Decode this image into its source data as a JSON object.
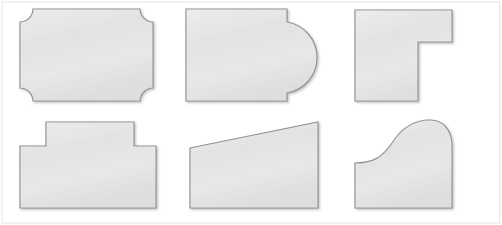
{
  "figure": {
    "width": 502,
    "height": 225,
    "background_color": "#ffffff",
    "frame": {
      "visible": true,
      "color": "#e8e8e8",
      "x": 2,
      "y": 2,
      "width": 498,
      "height": 221
    },
    "style": {
      "fill_color": "#e4e4e4",
      "fill_highlight_color": "#f2f2f2",
      "stroke_color": "#8a8a8a",
      "stroke_width": 1.2,
      "shadow_color": "#bdbdbd"
    },
    "grid": {
      "rows": 2,
      "columns": 3,
      "total_shapes": 6
    }
  },
  "shapes": [
    {
      "index": 1,
      "name": "concave-corner-rectangle",
      "label": "Rectangle with concave rounded corners",
      "row": 1,
      "column": 1,
      "bbox": {
        "x": 20,
        "y": 9,
        "width": 133,
        "height": 92
      },
      "corner_radius": 13,
      "sides": 4,
      "path": "M 33 9 L 140 9 A 13 13 0 0 0 153 22 L 153 88 A 13 13 0 0 0 140 101 L 33 101 A 13 13 0 0 0 20 88 L 20 22 A 13 13 0 0 0 33 9 Z"
    },
    {
      "index": 2,
      "name": "rectangle-with-semicircular-bulge",
      "label": "Rectangle with semicircular bulge on the right side",
      "row": 1,
      "column": 2,
      "bbox": {
        "x": 186,
        "y": 9,
        "width": 136,
        "height": 92
      },
      "bulge_radius": 36,
      "bulge_center": {
        "x": 287,
        "y": 57
      },
      "path": "M 186 9 L 287 9 L 287 22 A 36 36 0 0 1 287 93 L 287 101 L 186 101 Z"
    },
    {
      "index": 3,
      "name": "l-shape-polygon",
      "label": "L-shaped hexagon with notch in the lower right",
      "row": 1,
      "column": 3,
      "bbox": {
        "x": 355,
        "y": 10,
        "width": 97,
        "height": 91
      },
      "sides": 6,
      "notch_corner": {
        "x": 418,
        "y": 42
      },
      "path": "M 355 10 L 452 10 L 452 42 L 418 42 L 418 101 L 355 101 Z"
    },
    {
      "index": 4,
      "name": "t-shape-stepped-polygon",
      "label": "T-shaped octagon with raised central step",
      "row": 2,
      "column": 1,
      "bbox": {
        "x": 20,
        "y": 122,
        "width": 136,
        "height": 86
      },
      "sides": 8,
      "step": {
        "left": 46,
        "right": 134,
        "top": 122,
        "shoulder_y": 146
      },
      "path": "M 46 122 L 134 122 L 134 146 L 156 146 L 156 208 L 20 208 L 20 146 L 46 146 Z"
    },
    {
      "index": 5,
      "name": "right-trapezoid",
      "label": "Right trapezoid with top edge sloping upward to the right",
      "row": 2,
      "column": 2,
      "bbox": {
        "x": 190,
        "y": 122,
        "width": 128,
        "height": 86
      },
      "sides": 4,
      "path": "M 190 148 L 318 122 L 318 208 L 190 208 Z"
    },
    {
      "index": 6,
      "name": "ogee-s-curve-shape",
      "label": "Shape with S-curved (ogee) top edge",
      "row": 2,
      "column": 3,
      "bbox": {
        "x": 355,
        "y": 120,
        "width": 97,
        "height": 88
      },
      "curve_type": "ogee",
      "path": "M 355 163 C 372 163 382 158 392 143 C 404 124 418 120 430 120 C 444 120 452 131 452 146 L 452 208 L 355 208 Z"
    }
  ]
}
